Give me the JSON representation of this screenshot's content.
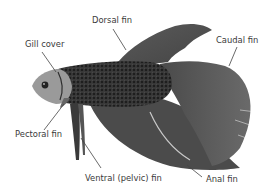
{
  "diagram": {
    "colors": {
      "background": "#ffffff",
      "label_text": "#3a3a3a",
      "leader_line": "#444444",
      "fin_dark": "#4a4a4a",
      "fin_mid": "#5e5e5e",
      "body_dark": "#2e2e2e",
      "head_light": "#b8b8b8"
    },
    "labels": [
      {
        "id": "dorsal-fin",
        "text": "Dorsal fin"
      },
      {
        "id": "gill-cover",
        "text": "Gill cover"
      },
      {
        "id": "caudal-fin",
        "text": "Caudal fin"
      },
      {
        "id": "pectoral-fin",
        "text": "Pectoral fin"
      },
      {
        "id": "ventral-fin",
        "text": "Ventral (pelvic) fin"
      },
      {
        "id": "anal-fin",
        "text": "Anal fin"
      }
    ]
  }
}
